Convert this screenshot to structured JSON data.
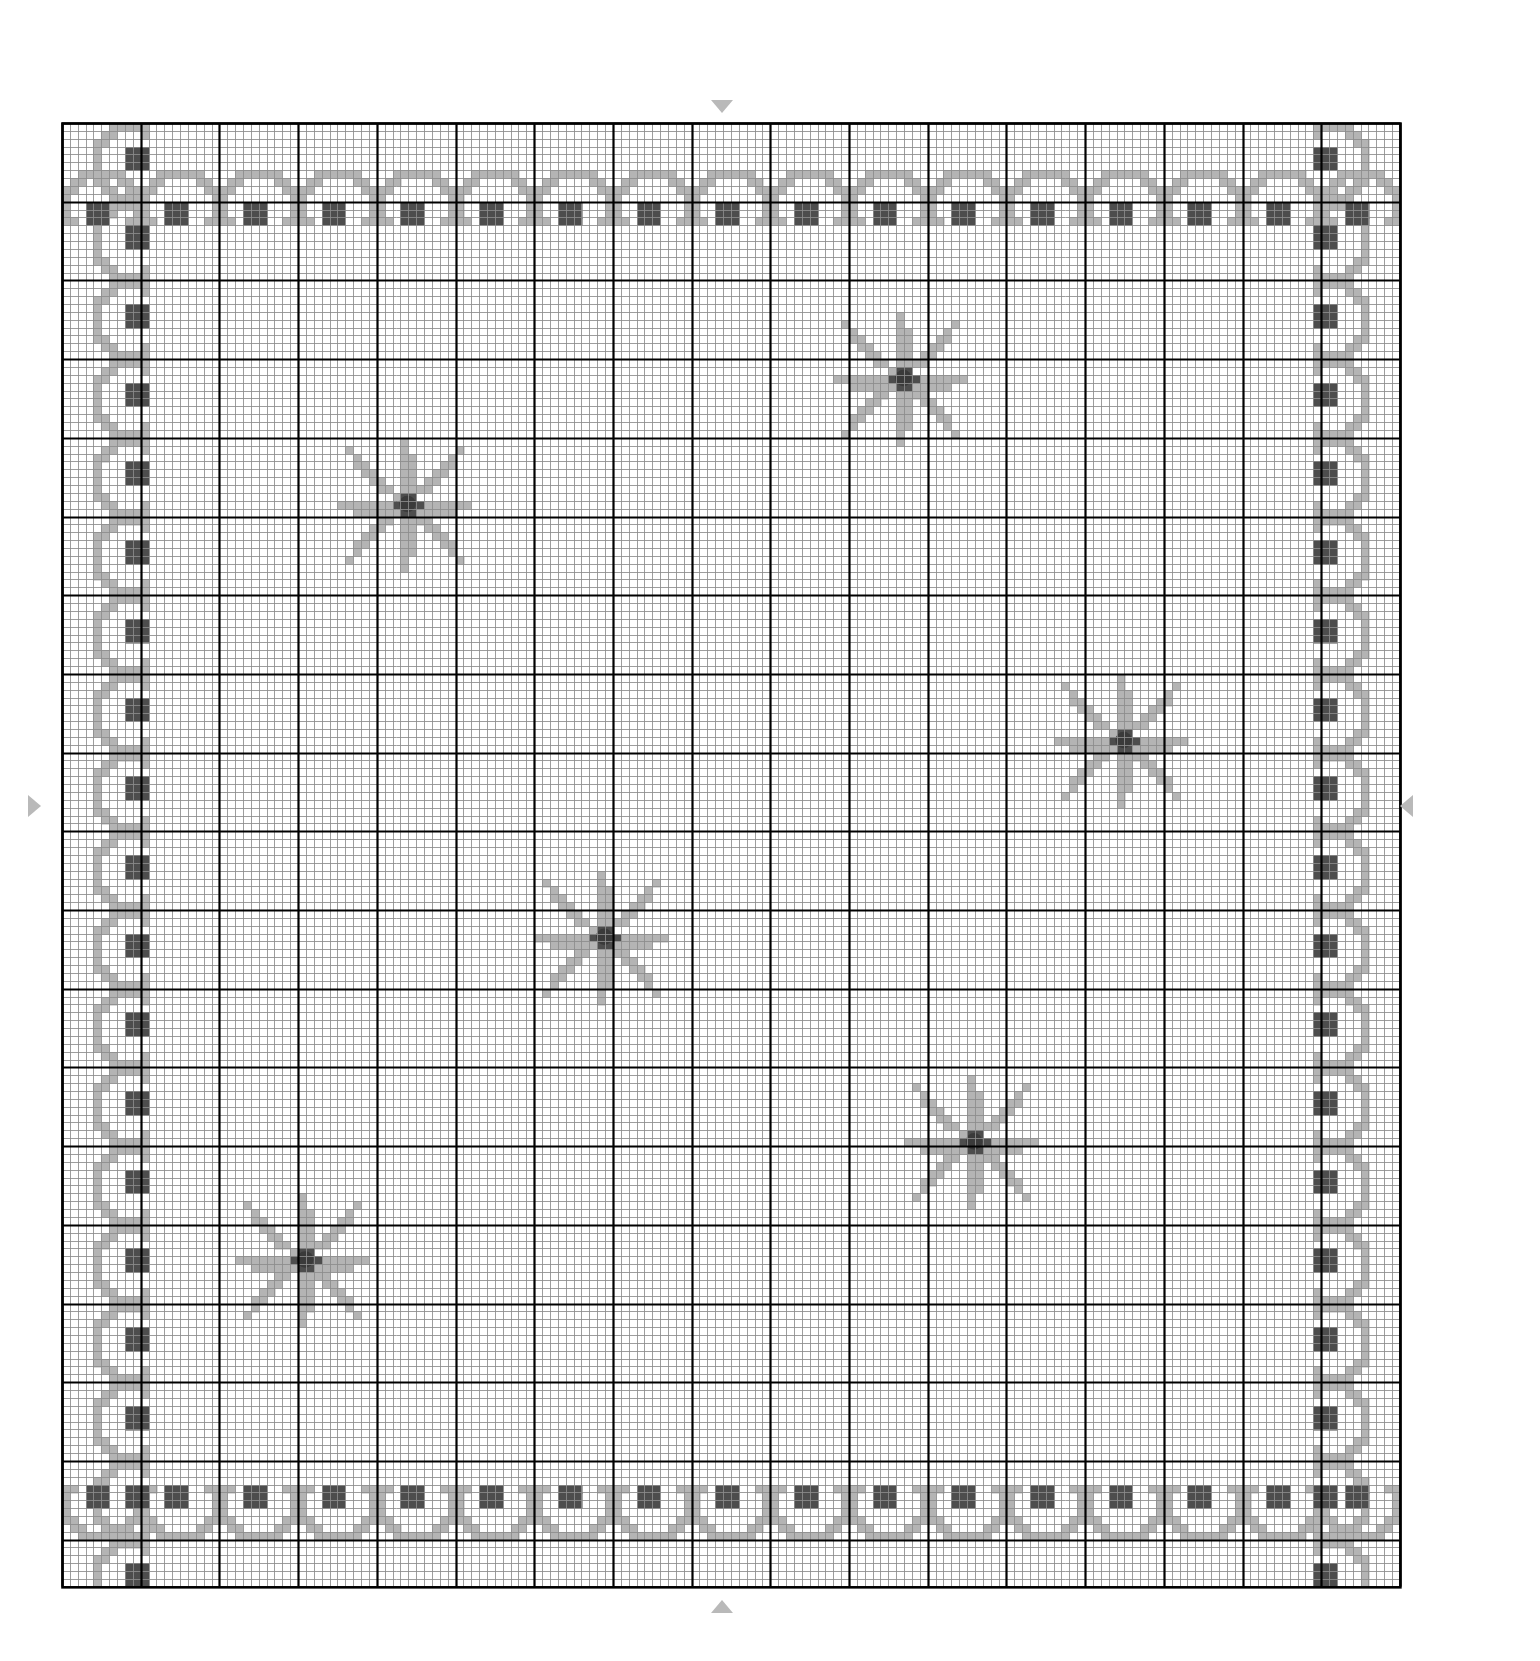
{
  "document": {
    "kind": "cross-stitch-pattern-chart",
    "title": "Cross Stitch Chart"
  },
  "chart_data": {
    "type": "heatmap",
    "title": "",
    "xlabel": "",
    "ylabel": "",
    "grid": true,
    "legend_position": "none",
    "columns": 170,
    "rows": 186,
    "cell_size_px": 7.87,
    "origin_x_px": 62,
    "origin_y_px": 123,
    "heavy_line_every": 10,
    "palette": {
      "background": "#ffffff",
      "light_grid": "#8c8c8c",
      "heavy_grid": "#000000",
      "light_fill": "#b4b4b4",
      "mid_fill": "#9a9a9a",
      "dark_fill": "#4d4d4d",
      "center_dot": "#3a3a3a",
      "marker": "#b9b9b9"
    },
    "symbols": [
      {
        "name": "light_fill",
        "color": "#b4b4b4",
        "label": "light grey stitch"
      },
      {
        "name": "mid_fill",
        "color": "#9a9a9a",
        "label": "medium grey stitch"
      },
      {
        "name": "dark_fill",
        "color": "#4d4d4d",
        "label": "dark grey stitch"
      }
    ],
    "border": {
      "style": "scalloped-wave-with-squares",
      "repeat_period_cells": 10,
      "inset_cells_top": 6,
      "inset_cells_left": 4,
      "inset_cells_right": 4,
      "inset_cells_bottom": 6
    },
    "motifs": [
      {
        "name": "eight-point-star-flower",
        "cx_cell": 43,
        "cy_cell": 48,
        "radius_cells": 8,
        "center_color": "#3a3a3a"
      },
      {
        "name": "eight-point-star-flower",
        "cx_cell": 106,
        "cy_cell": 32,
        "radius_cells": 8,
        "center_color": "#3a3a3a"
      },
      {
        "name": "eight-point-star-flower",
        "cx_cell": 134,
        "cy_cell": 78,
        "radius_cells": 8,
        "center_color": "#3a3a3a"
      },
      {
        "name": "eight-point-star-flower",
        "cx_cell": 68,
        "cy_cell": 103,
        "radius_cells": 8,
        "center_color": "#3a3a3a"
      },
      {
        "name": "eight-point-star-flower",
        "cx_cell": 115,
        "cy_cell": 129,
        "radius_cells": 8,
        "center_color": "#3a3a3a"
      },
      {
        "name": "eight-point-star-flower",
        "cx_cell": 30,
        "cy_cell": 144,
        "radius_cells": 8,
        "center_color": "#3a3a3a"
      }
    ],
    "center_markers": [
      {
        "name": "top-center-marker",
        "direction": "down",
        "x_px": 722,
        "y_px": 104
      },
      {
        "name": "bottom-center-marker",
        "direction": "up",
        "x_px": 722,
        "y_px": 1602
      },
      {
        "name": "left-center-marker",
        "direction": "right",
        "x_px": 31,
        "y_px": 803
      },
      {
        "name": "right-center-marker",
        "direction": "left",
        "x_px": 1404,
        "y_px": 803
      }
    ]
  }
}
